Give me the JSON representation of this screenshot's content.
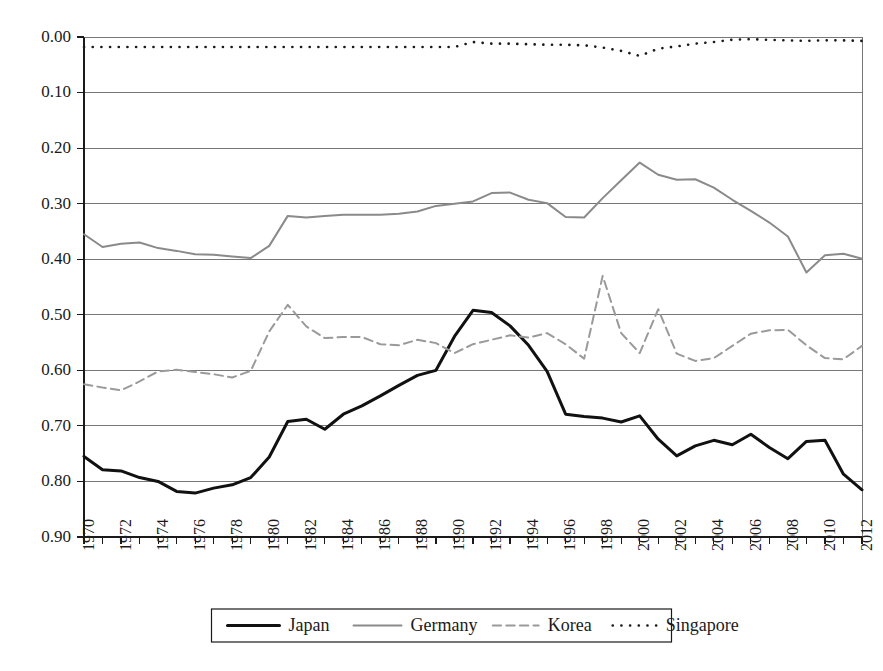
{
  "chart_data": {
    "type": "line",
    "title": "",
    "xlabel": "",
    "ylabel": "",
    "xlim": [
      1970,
      2012
    ],
    "ylim": [
      0.0,
      0.9
    ],
    "y_axis_inverted": true,
    "grid": true,
    "legend_position": "bottom",
    "y_ticks": [
      "0.00",
      "0.10",
      "0.20",
      "0.30",
      "0.40",
      "0.50",
      "0.60",
      "0.70",
      "0.80",
      "0.90"
    ],
    "y_tick_values": [
      0.0,
      0.1,
      0.2,
      0.3,
      0.4,
      0.5,
      0.6,
      0.7,
      0.8,
      0.9
    ],
    "x_tick_labels": [
      "1970",
      "1972",
      "1974",
      "1976",
      "1978",
      "1980",
      "1982",
      "1984",
      "1986",
      "1988",
      "1990",
      "1992",
      "1994",
      "1996",
      "1998",
      "2000",
      "2002",
      "2004",
      "2006",
      "2008",
      "2010",
      "2012"
    ],
    "x": [
      1970,
      1971,
      1972,
      1973,
      1974,
      1975,
      1976,
      1977,
      1978,
      1979,
      1980,
      1981,
      1982,
      1983,
      1984,
      1985,
      1986,
      1987,
      1988,
      1989,
      1990,
      1991,
      1992,
      1993,
      1994,
      1995,
      1996,
      1997,
      1998,
      1999,
      2000,
      2001,
      2002,
      2003,
      2004,
      2005,
      2006,
      2007,
      2008,
      2009,
      2010,
      2011,
      2012
    ],
    "series": [
      {
        "name": "Japan",
        "style": "solid",
        "color": "#111111",
        "width": 3.0,
        "values": [
          0.755,
          0.779,
          0.781,
          0.793,
          0.8,
          0.818,
          0.821,
          0.812,
          0.806,
          0.793,
          0.756,
          0.692,
          0.688,
          0.706,
          0.679,
          0.664,
          0.646,
          0.627,
          0.609,
          0.6,
          0.539,
          0.492,
          0.496,
          0.52,
          0.555,
          0.602,
          0.679,
          0.683,
          0.686,
          0.693,
          0.682,
          0.724,
          0.754,
          0.736,
          0.726,
          0.734,
          0.715,
          0.739,
          0.759,
          0.728,
          0.726,
          0.787,
          0.815
        ]
      },
      {
        "name": "Germany",
        "style": "solid",
        "color": "#8a8a8a",
        "width": 2.0,
        "values": [
          0.355,
          0.378,
          0.372,
          0.37,
          0.38,
          0.385,
          0.391,
          0.392,
          0.395,
          0.398,
          0.376,
          0.322,
          0.325,
          0.322,
          0.32,
          0.32,
          0.32,
          0.318,
          0.314,
          0.304,
          0.3,
          0.296,
          0.281,
          0.28,
          0.293,
          0.299,
          0.324,
          0.325,
          0.29,
          0.258,
          0.226,
          0.248,
          0.257,
          0.256,
          0.271,
          0.293,
          0.313,
          0.334,
          0.359,
          0.424,
          0.393,
          0.39,
          0.399
        ]
      },
      {
        "name": "Korea",
        "style": "dashed",
        "color": "#9a9a9a",
        "width": 2.0,
        "values": [
          0.625,
          0.631,
          0.636,
          0.62,
          0.602,
          0.599,
          0.603,
          0.607,
          0.613,
          0.601,
          0.53,
          0.482,
          0.521,
          0.542,
          0.54,
          0.54,
          0.553,
          0.555,
          0.545,
          0.551,
          0.569,
          0.553,
          0.545,
          0.537,
          0.541,
          0.533,
          0.553,
          0.579,
          0.43,
          0.533,
          0.569,
          0.49,
          0.57,
          0.583,
          0.578,
          0.556,
          0.534,
          0.528,
          0.527,
          0.555,
          0.578,
          0.58,
          0.556
        ]
      },
      {
        "name": "Singapore",
        "style": "dotted",
        "color": "#1a1a1a",
        "width": 2.6,
        "values": [
          0.018,
          0.018,
          0.018,
          0.018,
          0.018,
          0.018,
          0.018,
          0.018,
          0.018,
          0.018,
          0.018,
          0.018,
          0.018,
          0.018,
          0.018,
          0.018,
          0.018,
          0.018,
          0.018,
          0.018,
          0.018,
          0.009,
          0.012,
          0.012,
          0.013,
          0.014,
          0.014,
          0.015,
          0.019,
          0.025,
          0.034,
          0.021,
          0.017,
          0.012,
          0.009,
          0.005,
          0.004,
          0.005,
          0.006,
          0.007,
          0.006,
          0.006,
          0.007
        ]
      }
    ]
  },
  "legend": {
    "entries": [
      {
        "label": "Japan",
        "style": "solid"
      },
      {
        "label": "Germany",
        "style": "solid"
      },
      {
        "label": "Korea",
        "style": "dashed"
      },
      {
        "label": "Singapore",
        "style": "dotted"
      }
    ]
  }
}
